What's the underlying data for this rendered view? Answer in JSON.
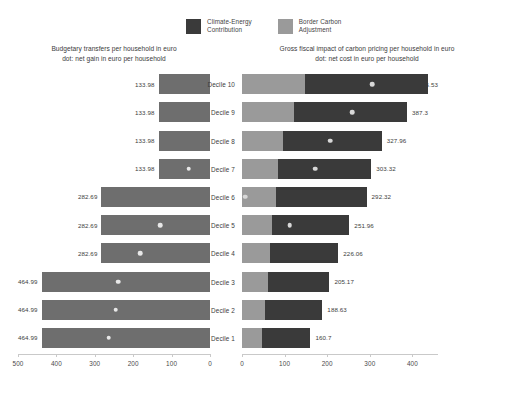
{
  "legend": {
    "items": [
      {
        "label": "Climate-Energy\nContribution",
        "color": "#3a3a3a",
        "icon": "legend-swatch-icon"
      },
      {
        "label": "Border Carbon\nAdjustment",
        "color": "#9a9a9a",
        "icon": "legend-swatch-icon"
      }
    ]
  },
  "panels": {
    "left": {
      "title": "Budgetary transfers per household in euro\ndot: net gain in euro per household"
    },
    "right": {
      "title": "Gross fiscal impact of carbon pricing per household in euro\ndot: net cost in euro per household"
    }
  },
  "chart_data": [
    {
      "type": "bar",
      "id": "budgetary-transfers",
      "title": "Budgetary transfers per household in euro",
      "subtitle": "dot: net gain in euro per household",
      "orientation": "horizontal",
      "direction": "right-to-left",
      "xlabel": "",
      "ylabel": "",
      "xlim": [
        0,
        500
      ],
      "xticks": [
        500,
        400,
        300,
        200,
        100,
        0
      ],
      "grid": false,
      "bar_color": "#6e6e6e",
      "dot_color": "#e8e8e8",
      "categories": [
        "Decile 10",
        "Decile 9",
        "Decile 8",
        "Decile 7",
        "Decile 6",
        "Decile 5",
        "Decile 4",
        "Decile 3",
        "Decile 2",
        "Decile 1"
      ],
      "values": [
        133.98,
        133.98,
        133.98,
        133.98,
        282.69,
        282.69,
        282.69,
        464.99,
        464.99,
        464.99
      ],
      "value_labels": [
        "133.98",
        "133.98",
        "133.98",
        "133.98",
        "282.69",
        "282.69",
        "282.69",
        "464.99",
        "464.99",
        "464.99"
      ],
      "dots": [
        null,
        null,
        null,
        56.0,
        null,
        130.0,
        182.0,
        266.0,
        272.0,
        290.0
      ]
    },
    {
      "type": "bar",
      "id": "gross-fiscal-impact",
      "title": "Gross fiscal impact of carbon pricing per household in euro",
      "subtitle": "dot: net cost in euro per household",
      "orientation": "horizontal",
      "direction": "left-to-right",
      "stacked": true,
      "xlabel": "",
      "ylabel": "",
      "xlim": [
        0,
        460
      ],
      "xticks": [
        0,
        100,
        200,
        300,
        400
      ],
      "grid": false,
      "dot_color": "#d8d8d8",
      "categories": [
        "Decile 10",
        "Decile 9",
        "Decile 8",
        "Decile 7",
        "Decile 6",
        "Decile 5",
        "Decile 4",
        "Decile 3",
        "Decile 2",
        "Decile 1"
      ],
      "series": [
        {
          "name": "Border Carbon Adjustment",
          "color": "#9a9a9a",
          "values": [
            148.0,
            121.0,
            96.0,
            85.0,
            80.0,
            71.0,
            66.0,
            60.0,
            55.0,
            48.0
          ]
        },
        {
          "name": "Climate-Energy Contribution",
          "color": "#3a3a3a",
          "values": [
            287.53,
            266.3,
            231.96,
            218.32,
            212.32,
            180.96,
            160.06,
            145.17,
            133.63,
            112.7
          ]
        }
      ],
      "totals": [
        435.53,
        387.3,
        327.96,
        303.32,
        292.32,
        251.96,
        226.06,
        205.17,
        188.63,
        160.7
      ],
      "value_labels": [
        "435.53",
        "387.3",
        "327.96",
        "303.32",
        "292.32",
        "251.96",
        "226.06",
        "205.17",
        "188.63",
        "160.7"
      ],
      "dots": [
        305.0,
        258.0,
        207.0,
        172.0,
        8.0,
        112.0,
        null,
        null,
        null,
        null
      ]
    }
  ]
}
